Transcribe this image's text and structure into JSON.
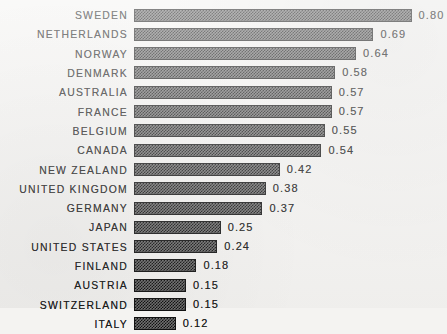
{
  "chart_data": {
    "type": "bar",
    "orientation": "horizontal",
    "title": "",
    "subtitle": "",
    "xlabel": "",
    "ylabel": "",
    "grid": false,
    "legend": null,
    "legend_position": "none",
    "xlim": [
      0,
      0.8
    ],
    "value_format": "0.00",
    "categories": [
      "SWEDEN",
      "NETHERLANDS",
      "NORWAY",
      "DENMARK",
      "AUSTRALIA",
      "FRANCE",
      "BELGIUM",
      "CANADA",
      "NEW ZEALAND",
      "UNITED KINGDOM",
      "GERMANY",
      "JAPAN",
      "UNITED STATES",
      "FINLAND",
      "AUSTRIA",
      "SWITZERLAND",
      "ITALY"
    ],
    "values": [
      0.8,
      0.69,
      0.64,
      0.58,
      0.57,
      0.57,
      0.55,
      0.54,
      0.42,
      0.38,
      0.37,
      0.25,
      0.24,
      0.18,
      0.15,
      0.15,
      0.12
    ],
    "value_labels": [
      "0.80",
      "0.69",
      "0.64",
      "0.58",
      "0.57",
      "0.57",
      "0.55",
      "0.54",
      "0.42",
      "0.38",
      "0.37",
      "0.25",
      "0.24",
      "0.18",
      "0.15",
      "0.15",
      "0.12"
    ],
    "bars": [
      {
        "label": "SWEDEN",
        "value": 0.8,
        "value_label": "0.80"
      },
      {
        "label": "NETHERLANDS",
        "value": 0.69,
        "value_label": "0.69"
      },
      {
        "label": "NORWAY",
        "value": 0.64,
        "value_label": "0.64"
      },
      {
        "label": "DENMARK",
        "value": 0.58,
        "value_label": "0.58"
      },
      {
        "label": "AUSTRALIA",
        "value": 0.57,
        "value_label": "0.57"
      },
      {
        "label": "FRANCE",
        "value": 0.57,
        "value_label": "0.57"
      },
      {
        "label": "BELGIUM",
        "value": 0.55,
        "value_label": "0.55"
      },
      {
        "label": "CANADA",
        "value": 0.54,
        "value_label": "0.54"
      },
      {
        "label": "NEW ZEALAND",
        "value": 0.42,
        "value_label": "0.42"
      },
      {
        "label": "UNITED KINGDOM",
        "value": 0.38,
        "value_label": "0.38"
      },
      {
        "label": "GERMANY",
        "value": 0.37,
        "value_label": "0.37"
      },
      {
        "label": "JAPAN",
        "value": 0.25,
        "value_label": "0.25"
      },
      {
        "label": "UNITED STATES",
        "value": 0.24,
        "value_label": "0.24"
      },
      {
        "label": "FINLAND",
        "value": 0.18,
        "value_label": "0.18"
      },
      {
        "label": "AUSTRIA",
        "value": 0.15,
        "value_label": "0.15"
      },
      {
        "label": "SWITZERLAND",
        "value": 0.15,
        "value_label": "0.15"
      },
      {
        "label": "ITALY",
        "value": 0.12,
        "value_label": "0.12"
      }
    ],
    "colors": {
      "background": "#f4f3f1",
      "bar_fill": "#707070",
      "bar_border": "#121212",
      "text": "#1b1b1b"
    }
  },
  "layout": {
    "bar_origin_x": 134,
    "px_per_unit": 347,
    "row_pitch": 19.3,
    "bar_height": 13,
    "label_gap": 7
  }
}
